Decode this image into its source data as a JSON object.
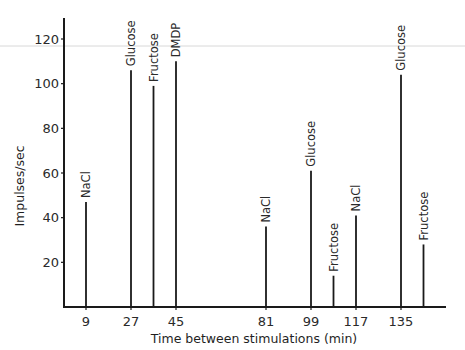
{
  "chart_data": {
    "type": "bar",
    "title": "",
    "xlabel": "Time between stimulations (min)",
    "ylabel": "Impulses/sec",
    "ylim": [
      0,
      130
    ],
    "xlim": [
      0,
      153
    ],
    "grid": false,
    "legend": null,
    "x_ticks": [
      9,
      27,
      45,
      81,
      99,
      117,
      135
    ],
    "y_ticks": [
      20,
      40,
      60,
      80,
      100,
      120
    ],
    "bars": [
      {
        "x": 9,
        "label": "NaCl",
        "value": 47
      },
      {
        "x": 27,
        "label": "Glucose",
        "value": 106
      },
      {
        "x": 36,
        "label": "Fructose",
        "value": 99
      },
      {
        "x": 45,
        "label": "DMDP",
        "value": 110
      },
      {
        "x": 81,
        "label": "NaCl",
        "value": 36
      },
      {
        "x": 99,
        "label": "Glucose",
        "value": 61
      },
      {
        "x": 108,
        "label": "Fructose",
        "value": 14
      },
      {
        "x": 117,
        "label": "NaCl",
        "value": 41
      },
      {
        "x": 135,
        "label": "Glucose",
        "value": 104
      },
      {
        "x": 144,
        "label": "Fructose",
        "value": 28
      }
    ]
  }
}
